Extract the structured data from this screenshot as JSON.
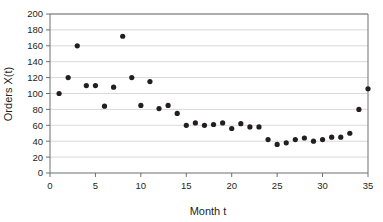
{
  "chart_data": {
    "type": "scatter",
    "title": "",
    "xlabel": "Month t",
    "ylabel": "Orders X(t)",
    "xlim": [
      0,
      35
    ],
    "ylim": [
      0,
      200
    ],
    "xticks": [
      0,
      5,
      10,
      15,
      20,
      25,
      30,
      35
    ],
    "xtick_labels": [
      "0",
      "5",
      "10",
      "15",
      "20",
      "25",
      "30",
      "35"
    ],
    "yticks": [
      0,
      20,
      40,
      60,
      80,
      100,
      120,
      140,
      160,
      180,
      200
    ],
    "ytick_labels": [
      "0",
      "20",
      "40",
      "60",
      "80",
      "100",
      "120",
      "140",
      "160",
      "180",
      "200"
    ],
    "grid": "horizontal",
    "legend": "none",
    "marker": "filled-circle",
    "marker_color": "#231f20",
    "grid_color": "#c9c9c9",
    "frame_color": "#6d6e71",
    "x": [
      1,
      2,
      3,
      4,
      5,
      6,
      7,
      8,
      9,
      10,
      11,
      12,
      13,
      14,
      15,
      16,
      17,
      18,
      19,
      20,
      21,
      22,
      23,
      24,
      25,
      26,
      27,
      28,
      29,
      30,
      31,
      32,
      33,
      34,
      35
    ],
    "values": [
      100,
      120,
      160,
      110,
      110,
      84,
      108,
      172,
      120,
      85,
      115,
      81,
      85,
      75,
      60,
      63,
      60,
      61,
      63,
      56,
      62,
      58,
      58,
      42,
      36,
      38,
      42,
      44,
      40,
      42,
      45,
      45,
      50,
      80,
      106
    ],
    "series": [
      {
        "name": "Orders",
        "values": [
          100,
          120,
          160,
          110,
          110,
          84,
          108,
          172,
          120,
          85,
          115,
          81,
          85,
          75,
          60,
          63,
          60,
          61,
          63,
          56,
          62,
          58,
          58,
          42,
          36,
          38,
          42,
          44,
          40,
          42,
          45,
          45,
          50,
          80,
          106
        ]
      }
    ]
  }
}
